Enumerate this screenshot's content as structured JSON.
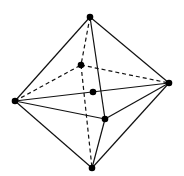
{
  "figure": {
    "vertices": [
      {
        "id": "top"
      },
      {
        "id": "back"
      },
      {
        "id": "center"
      },
      {
        "id": "left"
      },
      {
        "id": "right"
      },
      {
        "id": "front"
      },
      {
        "id": "bottom"
      }
    ],
    "edges": [
      {
        "from": "top",
        "to": "left",
        "style": "solid"
      },
      {
        "from": "top",
        "to": "right",
        "style": "solid"
      },
      {
        "from": "top",
        "to": "front",
        "style": "solid"
      },
      {
        "from": "left",
        "to": "front",
        "style": "solid"
      },
      {
        "from": "right",
        "to": "front",
        "style": "solid"
      },
      {
        "from": "left",
        "to": "right",
        "style": "solid"
      },
      {
        "from": "bottom",
        "to": "left",
        "style": "solid"
      },
      {
        "from": "bottom",
        "to": "right",
        "style": "solid"
      },
      {
        "from": "bottom",
        "to": "front",
        "style": "solid"
      },
      {
        "from": "top",
        "to": "back",
        "style": "dashed"
      },
      {
        "from": "back",
        "to": "bottom",
        "style": "dashed"
      },
      {
        "from": "left",
        "to": "back",
        "style": "dashed"
      },
      {
        "from": "back",
        "to": "right",
        "style": "dashed"
      }
    ]
  }
}
